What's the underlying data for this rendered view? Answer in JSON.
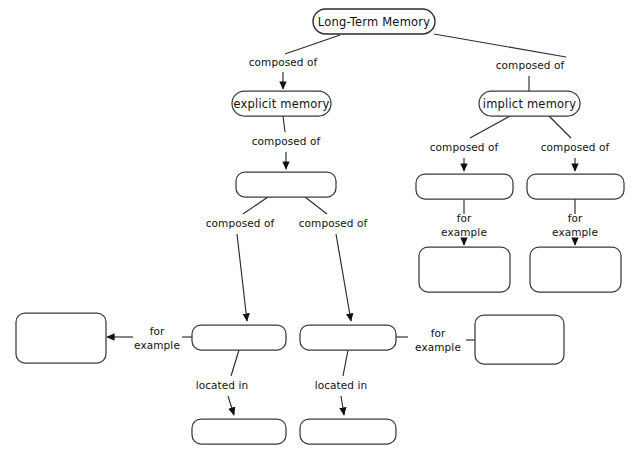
{
  "diagram": {
    "title": "Long-Term Memory",
    "type": "concept-map",
    "background_color": "#ffffff",
    "node_fill_color": "#ffffff",
    "node_stroke_color": "#3a3a3a",
    "text_color": "#111111",
    "nodes": [
      {
        "id": "root",
        "label": "Long-Term Memory",
        "filled": true,
        "x": 374,
        "y": 21,
        "w": 122,
        "h": 24,
        "shape": "rounded-pill"
      },
      {
        "id": "explicit",
        "label": "explicit memory",
        "filled": true,
        "x": 281,
        "y": 103,
        "w": 98,
        "h": 24,
        "shape": "rounded-pill"
      },
      {
        "id": "implicit",
        "label": "implict memory",
        "filled": true,
        "x": 529,
        "y": 103,
        "w": 100,
        "h": 24,
        "shape": "rounded-pill"
      },
      {
        "id": "blank-mid",
        "label": "",
        "filled": false,
        "x": 286,
        "y": 184,
        "w": 99,
        "h": 24,
        "shape": "rounded-rect"
      },
      {
        "id": "blank-r1",
        "label": "",
        "filled": false,
        "x": 464,
        "y": 186,
        "w": 96,
        "h": 25,
        "shape": "rounded-rect"
      },
      {
        "id": "blank-r2",
        "label": "",
        "filled": false,
        "x": 575,
        "y": 186,
        "w": 96,
        "h": 25,
        "shape": "rounded-rect"
      },
      {
        "id": "blank-r1-ex",
        "label": "",
        "filled": false,
        "x": 464,
        "y": 269,
        "w": 90,
        "h": 44,
        "shape": "rounded-rect"
      },
      {
        "id": "blank-r2-ex",
        "label": "",
        "filled": false,
        "x": 575,
        "y": 269,
        "w": 90,
        "h": 44,
        "shape": "rounded-rect"
      },
      {
        "id": "blank-m1",
        "label": "",
        "filled": false,
        "x": 239,
        "y": 337,
        "w": 93,
        "h": 25,
        "shape": "rounded-rect"
      },
      {
        "id": "blank-m2",
        "label": "",
        "filled": false,
        "x": 348,
        "y": 337,
        "w": 95,
        "h": 25,
        "shape": "rounded-rect"
      },
      {
        "id": "blank-left",
        "label": "",
        "filled": false,
        "x": 60,
        "y": 338,
        "w": 89,
        "h": 49,
        "shape": "rounded-rect"
      },
      {
        "id": "blank-right",
        "label": "",
        "filled": false,
        "x": 519,
        "y": 339,
        "w": 88,
        "h": 48,
        "shape": "rounded-rect"
      },
      {
        "id": "blank-b1",
        "label": "",
        "filled": false,
        "x": 239,
        "y": 431,
        "w": 93,
        "h": 25,
        "shape": "rounded-rect"
      },
      {
        "id": "blank-b2",
        "label": "",
        "filled": false,
        "x": 348,
        "y": 431,
        "w": 95,
        "h": 25,
        "shape": "rounded-rect"
      }
    ],
    "edges": [
      {
        "id": "e-root-explicit",
        "from": "root",
        "to": "explicit",
        "label": "composed of",
        "label_lines": [
          "composed of"
        ],
        "label_x": 283,
        "label_y": 63,
        "arrow": true
      },
      {
        "id": "e-root-implicit",
        "from": "root",
        "to": "implicit",
        "label": "composed of",
        "label_lines": [
          "composed of"
        ],
        "label_x": 530,
        "label_y": 66,
        "arrow": false
      },
      {
        "id": "e-exp-mid",
        "from": "explicit",
        "to": "blank-mid",
        "label": "composed of",
        "label_lines": [
          "composed of"
        ],
        "label_x": 286,
        "label_y": 142,
        "arrow": true
      },
      {
        "id": "e-imp-r1",
        "from": "implicit",
        "to": "blank-r1",
        "label": "composed of",
        "label_lines": [
          "composed of"
        ],
        "label_x": 464,
        "label_y": 148,
        "arrow": true
      },
      {
        "id": "e-imp-r2",
        "from": "implicit",
        "to": "blank-r2",
        "label": "composed of",
        "label_lines": [
          "composed of"
        ],
        "label_x": 575,
        "label_y": 148,
        "arrow": true
      },
      {
        "id": "e-mid-m1",
        "from": "blank-mid",
        "to": "blank-m1",
        "label": "composed of",
        "label_lines": [
          "composed of"
        ],
        "label_x": 240,
        "label_y": 224,
        "arrow": true
      },
      {
        "id": "e-mid-m2",
        "from": "blank-mid",
        "to": "blank-m2",
        "label": "composed of",
        "label_lines": [
          "composed of"
        ],
        "label_x": 333,
        "label_y": 224,
        "arrow": true
      },
      {
        "id": "e-r1-ex",
        "from": "blank-r1",
        "to": "blank-r1-ex",
        "label": "for example",
        "label_lines": [
          "for",
          "example"
        ],
        "label_x": 464,
        "label_y": 226,
        "arrow": true
      },
      {
        "id": "e-r2-ex",
        "from": "blank-r2",
        "to": "blank-r2-ex",
        "label": "for example",
        "label_lines": [
          "for",
          "example"
        ],
        "label_x": 575,
        "label_y": 226,
        "arrow": true
      },
      {
        "id": "e-m1-left",
        "from": "blank-m1",
        "to": "blank-left",
        "label": "for example",
        "label_lines": [
          "for",
          "example"
        ],
        "label_x": 156,
        "label_y": 339,
        "arrow": true
      },
      {
        "id": "e-m2-right",
        "from": "blank-m2",
        "to": "blank-right",
        "label": "for example",
        "label_lines": [
          "for",
          "example"
        ],
        "label_x": 440,
        "label_y": 340,
        "arrow": true
      },
      {
        "id": "e-m1-b1",
        "from": "blank-m1",
        "to": "blank-b1",
        "label": "located in",
        "label_lines": [
          "located in"
        ],
        "label_x": 222,
        "label_y": 386,
        "arrow": true
      },
      {
        "id": "e-m2-b2",
        "from": "blank-m2",
        "to": "blank-b2",
        "label": "located in",
        "label_lines": [
          "located in"
        ],
        "label_x": 340,
        "label_y": 386,
        "arrow": true
      }
    ]
  }
}
